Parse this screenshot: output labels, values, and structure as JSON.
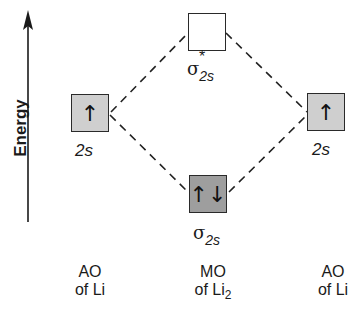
{
  "axis": {
    "label": "Energy"
  },
  "orbitals": {
    "left_ao": {
      "symbol": "↑",
      "label": "2s",
      "fill": "#cfcfcf"
    },
    "right_ao": {
      "symbol": "↑",
      "label": "2s",
      "fill": "#cfcfcf"
    },
    "bonding_mo": {
      "symbol": "↑↓",
      "label_main": "σ",
      "label_sub": "2s",
      "fill": "#9e9e9e"
    },
    "antibonding_mo": {
      "symbol": "",
      "label_main": "σ",
      "label_sub": "2s",
      "label_sup": "*",
      "fill": "#ffffff"
    }
  },
  "captions": {
    "left": {
      "line1": "AO",
      "line2": "of Li"
    },
    "center": {
      "line1": "MO",
      "line2": "of Li",
      "line2_sub": "2"
    },
    "right": {
      "line1": "AO",
      "line2": "of Li"
    }
  }
}
